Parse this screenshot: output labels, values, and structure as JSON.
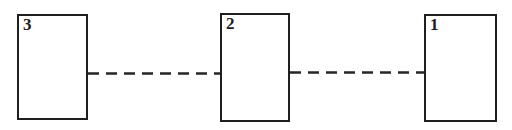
{
  "diagram": {
    "background_color": "#ffffff",
    "line_color": "#262626",
    "border_color": "#1f1f1f",
    "nodes": [
      {
        "label": "3"
      },
      {
        "label": "2"
      },
      {
        "label": "1"
      }
    ],
    "connectors": [
      {
        "from": "3",
        "to": "2",
        "style": "dashed"
      },
      {
        "from": "2",
        "to": "1",
        "style": "dashed"
      }
    ]
  }
}
